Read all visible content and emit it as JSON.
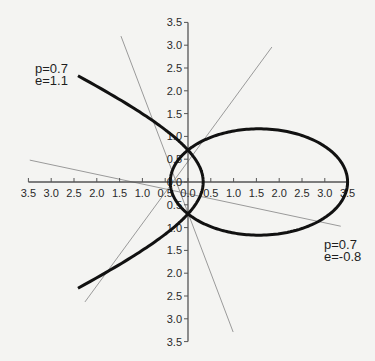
{
  "chart_data": {
    "type": "line",
    "title": "",
    "xlabel": "",
    "ylabel": "",
    "xlim": [
      -3.5,
      3.5
    ],
    "ylim": [
      -3.5,
      3.5
    ],
    "grid": false,
    "legend": "none",
    "x_ticks": [
      "3.5",
      "3.0",
      "2.5",
      "2.0",
      "1.5",
      "1.0",
      "0.5",
      "0.0",
      "0.5",
      "1.0",
      "1.5",
      "2.0",
      "2.5",
      "3.0",
      "3.5"
    ],
    "x_tick_values": [
      -3.5,
      -3.0,
      -2.5,
      -2.0,
      -1.5,
      -1.0,
      -0.5,
      0.0,
      0.5,
      1.0,
      1.5,
      2.0,
      2.5,
      3.0,
      3.5
    ],
    "y_ticks": [
      "3.5",
      "3.0",
      "2.5",
      "2.0",
      "1.5",
      "1.0",
      "0.5",
      "0.0",
      "0.5",
      "1.0",
      "1.5",
      "2.0",
      "2.5",
      "3.0",
      "3.5"
    ],
    "y_tick_values": [
      3.5,
      3.0,
      2.5,
      2.0,
      1.5,
      1.0,
      0.5,
      0.0,
      -0.5,
      -1.0,
      -1.5,
      -2.0,
      -2.5,
      -3.0,
      -3.5
    ],
    "series": [
      {
        "name": "hyperbola",
        "equation": "r = p / (1 + e cos θ)",
        "p": 0.7,
        "e": 1.1,
        "theta_deg_range": [
          -136,
          136
        ],
        "color": "#111111",
        "label": [
          "p=0.7",
          "e=1.1"
        ]
      },
      {
        "name": "ellipse",
        "equation": "r = p / (1 + e cos θ)",
        "p": 0.7,
        "e": -0.8,
        "theta_deg_range": [
          0,
          360
        ],
        "color": "#111111",
        "label": [
          "p=0.7",
          "e=-0.8"
        ]
      }
    ],
    "reference_lines": [
      {
        "from": [
          -1.47,
          3.2
        ],
        "to": [
          0.99,
          -3.29
        ],
        "color": "#9a9a9a"
      },
      {
        "from": [
          1.84,
          2.96
        ],
        "to": [
          -2.26,
          -2.63
        ],
        "color": "#9a9a9a"
      },
      {
        "from": [
          -3.47,
          0.48
        ],
        "to": [
          3.35,
          -0.97
        ],
        "color": "#9a9a9a"
      }
    ],
    "annotations": [
      {
        "text": "p=0.7\ne=1.1",
        "near": "upper-left"
      },
      {
        "text": "p=0.7\ne=-0.8",
        "near": "lower-right"
      }
    ]
  },
  "labels": {
    "hyperbola_p": "p=0.7",
    "hyperbola_e": "e=1.1",
    "ellipse_p": "p=0.7",
    "ellipse_e": "e=-0.8"
  }
}
